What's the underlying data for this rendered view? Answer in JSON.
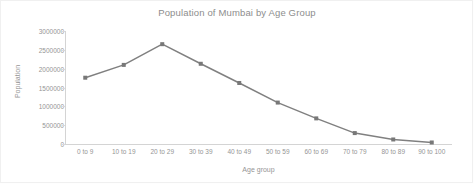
{
  "chart_data": {
    "type": "line",
    "title": "Population of Mumbai by Age Group",
    "xlabel": "Age group",
    "ylabel": "Population",
    "categories": [
      "0 to 9",
      "10 to 19",
      "20 to 29",
      "30 to 39",
      "40 to 49",
      "50 to 59",
      "60 to 69",
      "70 to 79",
      "80 to 89",
      "90 to 100"
    ],
    "values": [
      1760000,
      2100000,
      2650000,
      2130000,
      1620000,
      1100000,
      680000,
      290000,
      120000,
      40000
    ],
    "series": [
      {
        "name": "Population",
        "values": [
          1760000,
          2100000,
          2650000,
          2130000,
          1620000,
          1100000,
          680000,
          290000,
          120000,
          40000
        ]
      }
    ],
    "ylim": [
      0,
      3000000
    ],
    "ytick_labels": [
      "0",
      "500000",
      "1000000",
      "1500000",
      "2000000",
      "2500000",
      "3000000"
    ],
    "ytick_values": [
      0,
      500000,
      1000000,
      1500000,
      2000000,
      2500000,
      3000000
    ],
    "grid": false,
    "legend": "none",
    "line_color": "#808080",
    "marker_color": "#787878",
    "axis_color": "#d4d4d4",
    "text_color": "#959595",
    "background_color": "#ffffff"
  }
}
